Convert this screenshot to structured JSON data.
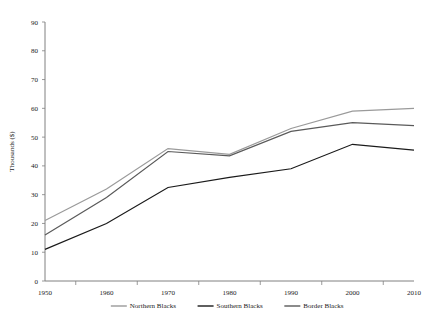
{
  "chart_data": {
    "type": "line",
    "title": "",
    "xlabel": "",
    "ylabel": "Thousands ($)",
    "categories": [
      "1950",
      "1960",
      "1970",
      "1980",
      "1990",
      "2000",
      "2010"
    ],
    "x": [
      1950,
      1960,
      1970,
      1980,
      1990,
      2000,
      2010
    ],
    "xlim": [
      1950,
      2010
    ],
    "ylim": [
      0,
      90
    ],
    "yticks": [
      0,
      10,
      20,
      30,
      40,
      50,
      60,
      70,
      80,
      90
    ],
    "ytick_labels": [
      "0",
      "10",
      "20",
      "30",
      "40",
      "50",
      "60",
      "70",
      "80",
      "90"
    ],
    "grid": false,
    "legend_position": "bottom",
    "series": [
      {
        "name": "Northern Blacks",
        "color": "#9a9a9a",
        "values": [
          21,
          32,
          46,
          44,
          53,
          59,
          60
        ]
      },
      {
        "name": "Southern Blacks",
        "color": "#1a1a1a",
        "values": [
          11,
          20,
          32.5,
          36,
          39,
          47.5,
          45.5
        ]
      },
      {
        "name": "Border Blacks",
        "color": "#5a5a5a",
        "values": [
          16,
          29,
          45,
          43.5,
          52,
          55,
          54
        ]
      }
    ]
  },
  "legend": {
    "entries": [
      {
        "label": "Northern Blacks",
        "color": "#9a9a9a"
      },
      {
        "label": "Southern Blacks",
        "color": "#1a1a1a"
      },
      {
        "label": "Border Blacks",
        "color": "#5a5a5a"
      }
    ]
  },
  "axes": {
    "y_axis_title": "Thousands ($)",
    "x_axis_title": ""
  }
}
